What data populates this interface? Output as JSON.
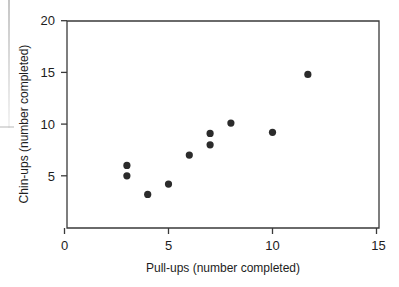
{
  "chart_data": {
    "type": "scatter",
    "title": "",
    "xlabel": "Pull-ups (number completed)",
    "ylabel": "Chin-ups (number completed)",
    "xlim": [
      0,
      15
    ],
    "ylim": [
      0,
      20
    ],
    "xticks": [
      0,
      5,
      10,
      15
    ],
    "xtick_labels": [
      "0",
      "5",
      "10",
      "15"
    ],
    "yticks": [
      5,
      10,
      15,
      20
    ],
    "ytick_labels": [
      "5",
      "10",
      "15",
      "20"
    ],
    "grid": false,
    "legend": null,
    "marker": "filled-circle",
    "marker_color": "#2b2b2b",
    "points": [
      {
        "x": 3,
        "y": 6.0
      },
      {
        "x": 3,
        "y": 5.0
      },
      {
        "x": 4,
        "y": 3.2
      },
      {
        "x": 5,
        "y": 4.2
      },
      {
        "x": 6,
        "y": 7.0
      },
      {
        "x": 7,
        "y": 9.1
      },
      {
        "x": 7,
        "y": 8.0
      },
      {
        "x": 8,
        "y": 10.1
      },
      {
        "x": 10,
        "y": 9.2
      },
      {
        "x": 11.7,
        "y": 14.8
      }
    ],
    "series": [
      {
        "name": "observations",
        "x": [
          3,
          3,
          4,
          5,
          6,
          7,
          7,
          8,
          10,
          11.7
        ],
        "values": [
          6.0,
          5.0,
          3.2,
          4.2,
          7.0,
          9.1,
          8.0,
          10.1,
          9.2,
          14.8
        ]
      }
    ]
  },
  "axis": {
    "x_title": "Pull-ups (number completed)",
    "y_title": "Chin-ups (number completed)",
    "x_tick_labels": [
      "0",
      "5",
      "10",
      "15"
    ],
    "y_tick_labels": [
      "5",
      "10",
      "15",
      "20"
    ]
  },
  "colors": {
    "marker": "#2b2b2b",
    "frame": "#3a3a3a",
    "text": "#1d1d1d",
    "background": "#ffffff"
  }
}
